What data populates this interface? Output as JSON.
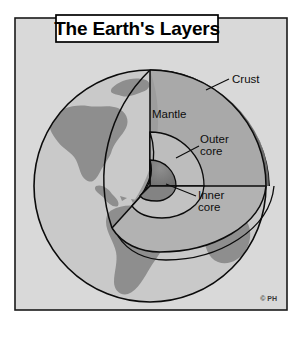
{
  "figure": {
    "title": "The Earth's Layers",
    "credit": "© PH",
    "type": "cutaway-cross-section-diagram"
  },
  "labels": {
    "crust": "Crust",
    "mantle": "Mantle",
    "outer_core_line1": "Outer",
    "outer_core_line2": "core",
    "inner_core_line1": "Inner",
    "inner_core_line2": "core"
  },
  "layers": [
    {
      "name": "Crust",
      "label": "Crust",
      "order": 1,
      "position": "outermost"
    },
    {
      "name": "Mantle",
      "label": "Mantle",
      "order": 2,
      "position": "below crust"
    },
    {
      "name": "Outer core",
      "label": "Outer core",
      "order": 3,
      "position": "below mantle"
    },
    {
      "name": "Inner core",
      "label": "Inner core",
      "order": 4,
      "position": "center"
    }
  ],
  "colors": {
    "page_background": "#ffffff",
    "panel_background": "#d8d8d8",
    "frame_border": "#1a1a1a",
    "title_box_fill": "#ffffff",
    "title_box_border": "#000000",
    "ocean": "#c9c9c9",
    "land": "#8e8e8e",
    "crust_band": "#6f6f6f",
    "mantle_fill": "#a7a7a7",
    "mantle_face": "#b4b4b4",
    "outer_core_fill": "#b9b9b9",
    "inner_core_fill": "#7d7d7d",
    "outline": "#0b0b0b",
    "label_text": "#0d0d0d"
  },
  "geometry": {
    "globe_center_x": 150,
    "globe_center_y": 186,
    "globe_radius": 116,
    "cut_apex_x": 150,
    "cut_apex_y": 70
  }
}
